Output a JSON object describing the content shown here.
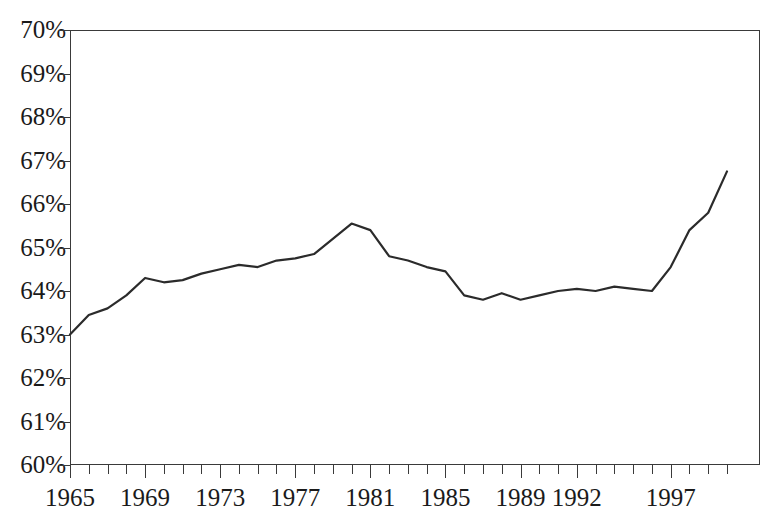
{
  "figure": {
    "title_remnant": "",
    "background_color": "#ffffff",
    "line_color": "#2b2b2b",
    "axis_color": "#3a3a3a"
  },
  "chart_data": {
    "type": "line",
    "title": "",
    "subtitle": "",
    "xlabel": "",
    "ylabel": "",
    "xlim": [
      1965,
      2000
    ],
    "ylim": [
      60,
      70
    ],
    "y_tick_labels": [
      "70%",
      "69%",
      "68%",
      "67%",
      "66%",
      "65%",
      "64%",
      "63%",
      "62%",
      "61%",
      "60%"
    ],
    "y_tick_values": [
      70,
      69,
      68,
      67,
      66,
      65,
      64,
      63,
      62,
      61,
      60
    ],
    "y_tick_step": 1,
    "x_tick_labels": [
      "1965",
      "1969",
      "1973",
      "1977",
      "1981",
      "1985",
      "1989",
      "1992",
      "1997"
    ],
    "x_tick_label_values": [
      1965,
      1969,
      1973,
      1977,
      1981,
      1985,
      1989,
      1992,
      1997
    ],
    "x_minor_tick_step": 1,
    "grid": false,
    "legend": null,
    "legend_position": "none",
    "value_suffix": "%",
    "x": [
      1965,
      1966,
      1967,
      1968,
      1969,
      1970,
      1971,
      1972,
      1973,
      1974,
      1975,
      1976,
      1977,
      1978,
      1979,
      1980,
      1981,
      1982,
      1983,
      1984,
      1985,
      1986,
      1987,
      1988,
      1989,
      1990,
      1991,
      1992,
      1993,
      1994,
      1995,
      1996,
      1997,
      1998,
      1999,
      2000
    ],
    "values": [
      63.0,
      63.45,
      63.6,
      63.9,
      64.3,
      64.2,
      64.25,
      64.4,
      64.5,
      64.6,
      64.55,
      64.7,
      64.75,
      64.85,
      65.2,
      65.55,
      65.4,
      64.8,
      64.7,
      64.55,
      64.45,
      63.9,
      63.8,
      63.95,
      63.8,
      63.9,
      64.0,
      64.05,
      64.0,
      64.1,
      64.05,
      64.0,
      64.55,
      65.4,
      65.8,
      66.75
    ],
    "series": [
      {
        "name": "rate",
        "values": [
          63.0,
          63.45,
          63.6,
          63.9,
          64.3,
          64.2,
          64.25,
          64.4,
          64.5,
          64.6,
          64.55,
          64.7,
          64.75,
          64.85,
          65.2,
          65.55,
          65.4,
          64.8,
          64.7,
          64.55,
          64.45,
          63.9,
          63.8,
          63.95,
          63.8,
          63.9,
          64.0,
          64.05,
          64.0,
          64.1,
          64.05,
          64.0,
          64.55,
          65.4,
          65.8,
          66.75
        ],
        "color": "#2b2b2b",
        "line_width": 2.2,
        "markers": false
      }
    ],
    "annotations": [],
    "notes": {
      "minimum": {
        "x": 1965,
        "y": 63.0
      },
      "maximum": {
        "x": 2000,
        "y": 66.75
      },
      "local_peak": {
        "x": 1980,
        "y": 65.55
      },
      "local_trough": {
        "x": 1987,
        "y": 63.8
      }
    }
  }
}
